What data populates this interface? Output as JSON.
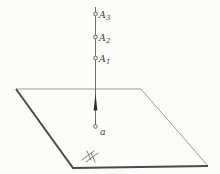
{
  "figure": {
    "kind": "geometry-diagram",
    "colors": {
      "background": "#fcfcfb",
      "thin_edge": "#9c9c9c",
      "medium_line": "#6b6b6b",
      "thick_edge": "#4a4a4a",
      "arrow_fill": "#2e2e2e",
      "point_stroke": "#5a5a5a",
      "label_text": "#3f3f3f"
    },
    "labels": {
      "A3": {
        "base": "A",
        "sub": "3"
      },
      "A2": {
        "base": "A",
        "sub": "2"
      },
      "A1": {
        "base": "A",
        "sub": "1"
      },
      "a": {
        "base": "a",
        "sub": ""
      }
    }
  }
}
